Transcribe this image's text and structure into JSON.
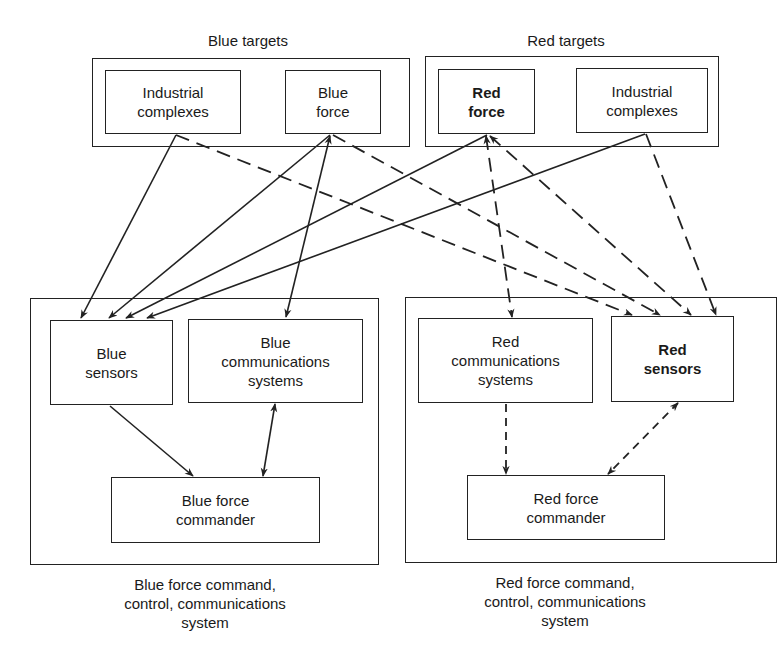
{
  "blue_targets": {
    "title": "Blue targets",
    "industrial_complexes": "Industrial\ncomplexes",
    "force": "Blue\nforce"
  },
  "red_targets": {
    "title": "Red targets",
    "force": "Red\nforce",
    "industrial_complexes": "Industrial\ncomplexes"
  },
  "blue_c3": {
    "caption": "Blue force command,\ncontrol, communications\nsystem",
    "sensors": "Blue\nsensors",
    "communications": "Blue\ncommunications\nsystems",
    "commander": "Blue force\ncommander"
  },
  "red_c3": {
    "caption": "Red force command,\ncontrol, communications\nsystem",
    "communications": "Red\ncommunications\nsystems",
    "sensors": "Red\nsensors",
    "commander": "Red force\ncommander"
  },
  "edges": [
    {
      "from": "blue-industrial-complexes",
      "to": "blue-sensors",
      "style": "solid"
    },
    {
      "from": "blue-force",
      "to": "blue-sensors",
      "style": "solid"
    },
    {
      "from": "blue-force",
      "to": "blue-communications",
      "style": "solid",
      "bidirectional": true
    },
    {
      "from": "red-force",
      "to": "blue-sensors",
      "style": "solid"
    },
    {
      "from": "red-industrial-complexes",
      "to": "blue-sensors",
      "style": "solid"
    },
    {
      "from": "blue-sensors",
      "to": "blue-force-commander",
      "style": "solid"
    },
    {
      "from": "blue-communications",
      "to": "blue-force-commander",
      "style": "solid",
      "bidirectional": true
    },
    {
      "from": "blue-industrial-complexes",
      "to": "red-sensors",
      "style": "dashed"
    },
    {
      "from": "blue-force",
      "to": "red-sensors",
      "style": "dashed"
    },
    {
      "from": "red-force",
      "to": "red-communications",
      "style": "dashed",
      "bidirectional": true
    },
    {
      "from": "red-force",
      "to": "red-sensors",
      "style": "dashed"
    },
    {
      "from": "red-industrial-complexes",
      "to": "red-sensors",
      "style": "dashed"
    },
    {
      "from": "red-communications",
      "to": "red-force-commander",
      "style": "dashed"
    },
    {
      "from": "red-sensors",
      "to": "red-force-commander",
      "style": "dashed",
      "bidirectional": true
    }
  ]
}
